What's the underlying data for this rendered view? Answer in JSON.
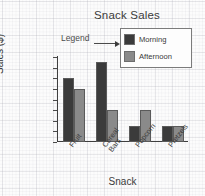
{
  "chart_data": {
    "type": "bar",
    "title": "Snack Sales",
    "xlabel": "Snack",
    "ylabel": "Sales ($)",
    "categories": [
      "Fruit",
      "Cereal Bars",
      "Popcorn",
      "Pretzels"
    ],
    "series": [
      {
        "name": "Morning",
        "values": [
          24,
          30,
          6,
          6
        ],
        "color": "#3b3b3b"
      },
      {
        "name": "Afternoon",
        "values": [
          20,
          12,
          12,
          6
        ],
        "color": "#8a8a8a"
      }
    ],
    "ylim": [
      0,
      32
    ],
    "yticks": [
      0,
      4,
      8,
      12,
      16,
      20,
      24,
      28,
      32
    ],
    "grid": false,
    "legend_position": "top-right"
  },
  "annotations": {
    "legend_callout": "Legend"
  },
  "legend": {
    "entries": [
      {
        "label": "Morning",
        "color": "#3b3b3b"
      },
      {
        "label": "Afternoon",
        "color": "#8a8a8a"
      }
    ]
  }
}
